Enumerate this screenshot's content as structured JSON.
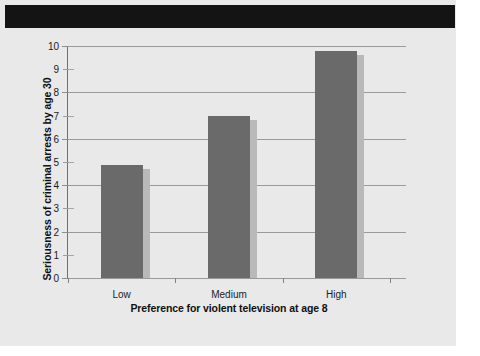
{
  "page": {
    "background_color": "#e9e9e9",
    "header_band_color": "#141414"
  },
  "chart_data": {
    "type": "bar",
    "title": "",
    "subtitle": "",
    "categories": [
      "Low",
      "Medium",
      "High"
    ],
    "values": [
      4.85,
      7.0,
      9.8
    ],
    "series": [
      {
        "name": "Seriousness of criminal arrests by age 30",
        "values": [
          4.85,
          7.0,
          9.8
        ]
      }
    ],
    "xlabel": "Preference for violent television at age 8",
    "ylabel": "Seriousness of criminal arrests by age 30",
    "ylim": [
      0,
      10
    ],
    "yticks": [
      0,
      1,
      2,
      3,
      4,
      5,
      6,
      7,
      8,
      9,
      10
    ],
    "ytick_labels": [
      "0",
      "1",
      "2",
      "3",
      "4",
      "5",
      "6",
      "7",
      "8",
      "9",
      "10"
    ],
    "major_gridline_values": [
      0,
      2,
      4,
      6,
      8,
      10
    ],
    "minor_tick_values": [
      1,
      3,
      5,
      7,
      9
    ],
    "grid": true,
    "legend": false,
    "legend_position": "none",
    "bar_color": "#6a6a6a",
    "bar_shadow_color": "#b9b9b9",
    "gridline_color": "#9a9a9a",
    "axis_color": "#6f6f6f",
    "plot_background": "#ededed"
  }
}
